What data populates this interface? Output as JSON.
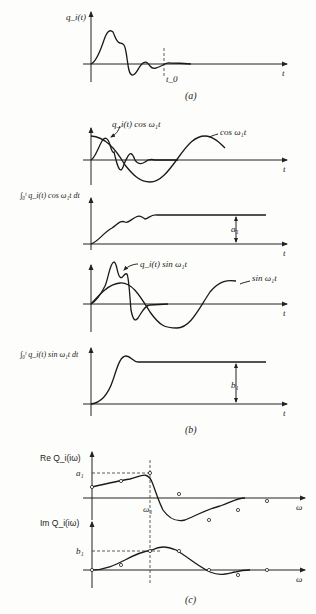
{
  "panel_a": {
    "ylabel": "q_i(t)",
    "xlabel": "t",
    "marker": "t_0",
    "caption": "(a)"
  },
  "panel_b": {
    "plot1": {
      "curve1_label": "q_i(t) cos ω₁t",
      "curve2_label": "cos ω₁t",
      "xlabel": "t"
    },
    "plot2": {
      "ylabel": "∫₀ᵗ q_i(t) cos ω₁t dt",
      "xlabel": "t",
      "value_label": "a₁"
    },
    "plot3": {
      "curve1_label": "q_i(t) sin ω₁t",
      "curve2_label": "sin ω₁t",
      "xlabel": "t"
    },
    "plot4": {
      "ylabel": "∫₀ᵗ q_i(t) sin ω₁t dt",
      "xlabel": "t",
      "value_label": "b₁"
    },
    "caption": "(b)"
  },
  "panel_c": {
    "re": {
      "ylabel": "Re Q_i(iω)",
      "xlabel": "ω",
      "level_label": "a₁",
      "freq_label": "ω₁"
    },
    "im": {
      "ylabel": "Im Q_i(iω)",
      "xlabel": "ω",
      "level_label": "b₁"
    },
    "caption": "(c)"
  }
}
